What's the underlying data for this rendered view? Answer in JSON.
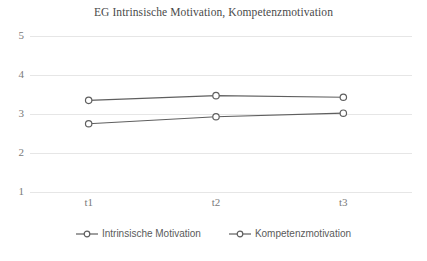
{
  "chart_data": {
    "type": "line",
    "title": "EG Intrinsische Motivation, Kompetenzmotivation",
    "xlabel": "",
    "ylabel": "",
    "categories": [
      "t1",
      "t2",
      "t3"
    ],
    "series": [
      {
        "name": "Intrinsische Motivation",
        "values": [
          2.75,
          2.93,
          3.02
        ],
        "color": "#5f5f5f",
        "marker": "circle-open"
      },
      {
        "name": "Kompetenzmotivation",
        "values": [
          3.35,
          3.47,
          3.43
        ],
        "color": "#5f5f5f",
        "marker": "circle-open"
      }
    ],
    "ylim": [
      1,
      5
    ],
    "yticks": [
      1,
      2,
      3,
      4,
      5
    ],
    "ytick_labels": [
      "1",
      "2",
      "3",
      "4",
      "5"
    ],
    "grid": true,
    "grid_axis": "y",
    "legend_position": "bottom"
  },
  "style": {
    "grid_color": "#e6e6e6",
    "tick_text_color": "#7a7a7a",
    "title_color": "#4a4a4a",
    "background": "#ffffff"
  }
}
